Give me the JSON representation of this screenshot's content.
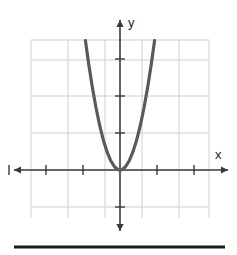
{
  "figure": {
    "width": 237,
    "height": 255,
    "background_color": "#ffffff",
    "bottom_rule_color": "#1c1c1c"
  },
  "chart_data": {
    "type": "line",
    "title": "",
    "subtitle": "",
    "xlabel": "x",
    "ylabel": "y",
    "function_label": "y = 4x²",
    "curve_color": "#5a5a5a",
    "axis_color": "#3a3a3a",
    "grid_color": "#cfcfcf",
    "grid": true,
    "legend": false,
    "legend_position": "none",
    "xlim": [
      -3,
      2.4
    ],
    "ylim": [
      -1.3,
      3.5
    ],
    "xticks": [
      -3,
      -2,
      -1,
      1,
      2
    ],
    "yticks": [
      -1,
      1,
      2,
      3
    ],
    "xtick_labels": [
      "",
      "",
      "",
      "",
      ""
    ],
    "ytick_labels": [
      "",
      "",
      "",
      ""
    ],
    "x": [
      -0.935,
      -0.85,
      -0.75,
      -0.65,
      -0.55,
      -0.45,
      -0.35,
      -0.25,
      -0.15,
      -0.05,
      0,
      0.05,
      0.15,
      0.25,
      0.35,
      0.45,
      0.55,
      0.65,
      0.75,
      0.85,
      0.935
    ],
    "values": [
      3.5,
      2.89,
      2.25,
      1.69,
      1.21,
      0.81,
      0.49,
      0.25,
      0.09,
      0.01,
      0,
      0.01,
      0.09,
      0.25,
      0.49,
      0.81,
      1.21,
      1.69,
      2.25,
      2.89,
      3.5
    ],
    "series": [
      {
        "name": "parabola",
        "values": [
          3.5,
          2.89,
          2.25,
          1.69,
          1.21,
          0.81,
          0.49,
          0.25,
          0.09,
          0.01,
          0,
          0.01,
          0.09,
          0.25,
          0.49,
          0.81,
          1.21,
          1.69,
          2.25,
          2.89,
          3.5
        ]
      }
    ],
    "vertex": [
      0,
      0
    ],
    "annotations": []
  },
  "geometry": {
    "origin_x": 120,
    "origin_y": 170,
    "unit_x": 37,
    "unit_y": 37,
    "grid_left": 31,
    "grid_right": 209,
    "grid_top": 40,
    "grid_bottom": 218,
    "grid_v_lines": [
      31,
      68,
      105,
      142,
      179,
      209
    ],
    "grid_h_lines": [
      40,
      60,
      96,
      133,
      170,
      207
    ],
    "x_axis_start": 14,
    "x_axis_end": 228,
    "y_axis_start": 20,
    "y_axis_end": 231,
    "tick_len": 5,
    "curve_width": 3.2,
    "bottom_rule": {
      "x1": 14,
      "x2": 225,
      "y": 247,
      "thickness": 3
    }
  }
}
